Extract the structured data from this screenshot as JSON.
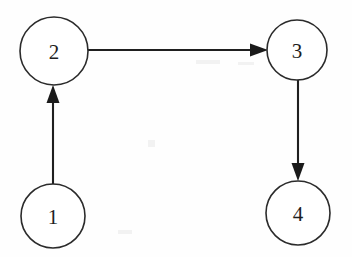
{
  "diagram": {
    "background_color": "#fefefe",
    "stroke_color": "#2b2b2b",
    "label_color": "#1e1e1e",
    "arrow_color": "#1a1a1a",
    "width": 352,
    "height": 257,
    "nodes": [
      {
        "id": "n1",
        "label": "1",
        "cx": 53,
        "cy": 216,
        "r": 32
      },
      {
        "id": "n2",
        "label": "2",
        "cx": 54,
        "cy": 51,
        "r": 34
      },
      {
        "id": "n3",
        "label": "3",
        "cx": 297,
        "cy": 50,
        "r": 30
      },
      {
        "id": "n4",
        "label": "4",
        "cx": 298,
        "cy": 213,
        "r": 32
      }
    ],
    "edges": [
      {
        "id": "e1",
        "from": "1",
        "to": "2",
        "direction": "up",
        "x1": 53,
        "y1": 184,
        "x2": 53,
        "y2": 86
      },
      {
        "id": "e2",
        "from": "2",
        "to": "3",
        "direction": "right",
        "x1": 88,
        "y1": 50,
        "x2": 267,
        "y2": 50
      },
      {
        "id": "e3",
        "from": "3",
        "to": "4",
        "direction": "down",
        "x1": 298,
        "y1": 80,
        "x2": 298,
        "y2": 181
      }
    ]
  }
}
